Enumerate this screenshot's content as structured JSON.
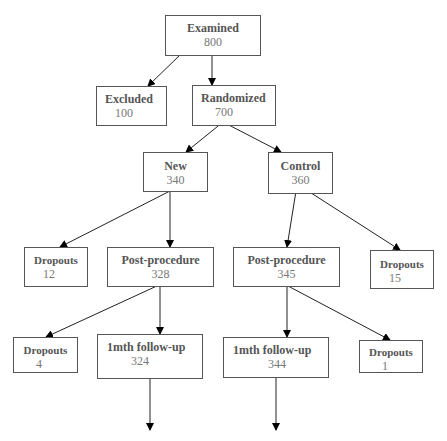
{
  "diagram": {
    "type": "flowchart",
    "nodes": [
      {
        "id": "examined",
        "label": "Examined",
        "count": "800"
      },
      {
        "id": "excluded",
        "label": "Excluded",
        "count": "100"
      },
      {
        "id": "randomized",
        "label": "Randomized",
        "count": "700"
      },
      {
        "id": "new",
        "label": "New",
        "count": "340"
      },
      {
        "id": "control",
        "label": "Control",
        "count": "360"
      },
      {
        "id": "new_dropouts",
        "label": "Dropouts",
        "count": "12"
      },
      {
        "id": "new_post",
        "label": "Post-procedure",
        "count": "328"
      },
      {
        "id": "control_post",
        "label": "Post-procedure",
        "count": "345"
      },
      {
        "id": "control_dropouts",
        "label": "Dropouts",
        "count": "15"
      },
      {
        "id": "new_post_dropouts",
        "label": "Dropouts",
        "count": "4"
      },
      {
        "id": "new_followup",
        "label": "1mth follow-up",
        "count": "324"
      },
      {
        "id": "control_followup",
        "label": "1mth follow-up",
        "count": "344"
      },
      {
        "id": "control_post_dropouts",
        "label": "Dropouts",
        "count": "1"
      }
    ],
    "edges": [
      {
        "from": "examined",
        "to": "excluded"
      },
      {
        "from": "examined",
        "to": "randomized"
      },
      {
        "from": "randomized",
        "to": "new"
      },
      {
        "from": "randomized",
        "to": "control"
      },
      {
        "from": "new",
        "to": "new_dropouts"
      },
      {
        "from": "new",
        "to": "new_post"
      },
      {
        "from": "control",
        "to": "control_post"
      },
      {
        "from": "control",
        "to": "control_dropouts"
      },
      {
        "from": "new_post",
        "to": "new_post_dropouts"
      },
      {
        "from": "new_post",
        "to": "new_followup"
      },
      {
        "from": "control_post",
        "to": "control_followup"
      },
      {
        "from": "control_post",
        "to": "control_post_dropouts"
      },
      {
        "from": "new_followup",
        "to": "continues"
      },
      {
        "from": "control_followup",
        "to": "continues"
      }
    ]
  }
}
